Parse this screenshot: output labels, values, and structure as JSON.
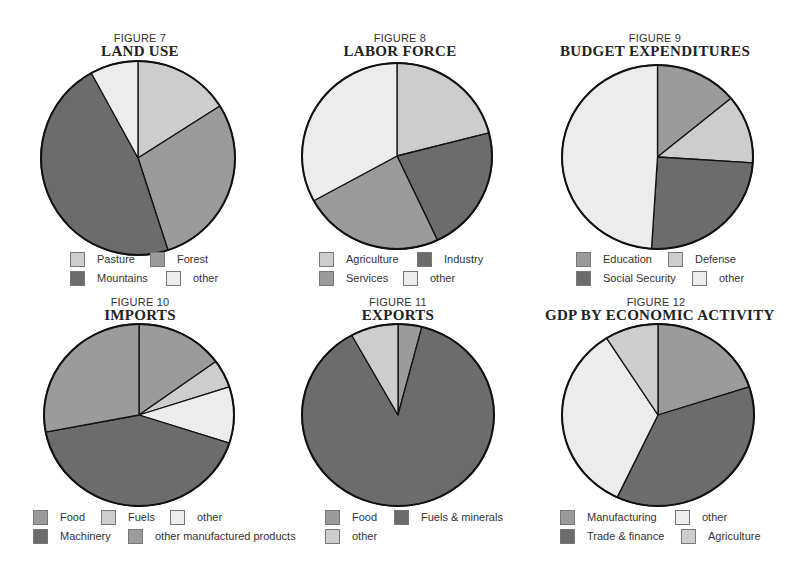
{
  "colors": {
    "light": "#cdcdcd",
    "mid": "#9b9b9b",
    "dark": "#6c6c6c",
    "white": "#ececec",
    "outline": "#111111"
  },
  "chart_data": [
    {
      "type": "pie",
      "figure_label": "FIGURE 7",
      "title": "LAND USE",
      "categories": [
        "Pasture",
        "Forest",
        "Mountains",
        "other"
      ],
      "values": [
        16,
        29,
        47,
        8
      ],
      "fills": [
        "light",
        "mid",
        "dark",
        "white"
      ],
      "legend": [
        {
          "label": "Pasture",
          "fill": "light"
        },
        {
          "label": "Forest",
          "fill": "mid"
        },
        {
          "label": "Mountains",
          "fill": "dark"
        },
        {
          "label": "other",
          "fill": "white"
        }
      ]
    },
    {
      "type": "pie",
      "figure_label": "FIGURE 8",
      "title": "LABOR FORCE",
      "categories": [
        "Agriculture",
        "Industry",
        "Services",
        "other"
      ],
      "values": [
        21,
        22,
        24,
        33
      ],
      "fills": [
        "light",
        "dark",
        "mid",
        "white"
      ],
      "legend": [
        {
          "label": "Agriculture",
          "fill": "light"
        },
        {
          "label": "Industry",
          "fill": "dark"
        },
        {
          "label": "Services",
          "fill": "mid"
        },
        {
          "label": "other",
          "fill": "white"
        }
      ]
    },
    {
      "type": "pie",
      "figure_label": "FIGURE 9",
      "title": "BUDGET EXPENDITURES",
      "categories": [
        "Education",
        "Defense",
        "Social Security",
        "other"
      ],
      "values": [
        14,
        12,
        25,
        49
      ],
      "fills": [
        "mid",
        "light",
        "dark",
        "white"
      ],
      "legend": [
        {
          "label": "Education",
          "fill": "mid"
        },
        {
          "label": "Defense",
          "fill": "light"
        },
        {
          "label": "Social Security",
          "fill": "dark"
        },
        {
          "label": "other",
          "fill": "white"
        }
      ]
    },
    {
      "type": "pie",
      "figure_label": "FIGURE 10",
      "title": "IMPORTS",
      "categories": [
        "Food",
        "Fuels",
        "other",
        "Machinery",
        "other manufactured products"
      ],
      "values": [
        15,
        5,
        10,
        42,
        28
      ],
      "fills": [
        "mid",
        "light",
        "white",
        "dark",
        "mid"
      ],
      "legend": [
        {
          "label": "Food",
          "fill": "mid"
        },
        {
          "label": "Fuels",
          "fill": "light"
        },
        {
          "label": "other",
          "fill": "white"
        },
        {
          "label": "Machinery",
          "fill": "dark"
        },
        {
          "label": "other manufactured products",
          "fill": "mid"
        }
      ]
    },
    {
      "type": "pie",
      "figure_label": "FIGURE 11",
      "title": "EXPORTS",
      "categories": [
        "Food",
        "Fuels & minerals",
        "other"
      ],
      "values": [
        4,
        88,
        8
      ],
      "fills": [
        "mid",
        "dark",
        "light"
      ],
      "legend": [
        {
          "label": "Food",
          "fill": "mid"
        },
        {
          "label": "Fuels & minerals",
          "fill": "dark"
        },
        {
          "label": "other",
          "fill": "light"
        }
      ]
    },
    {
      "type": "pie",
      "figure_label": "FIGURE 12",
      "title": "GDP BY ECONOMIC ACTIVITY",
      "categories": [
        "Manufacturing",
        "Trade & finance",
        "other",
        "Agriculture"
      ],
      "values": [
        20,
        37,
        34,
        9
      ],
      "fills": [
        "mid",
        "dark",
        "white",
        "light"
      ],
      "legend": [
        {
          "label": "Manufacturing",
          "fill": "mid"
        },
        {
          "label": "other",
          "fill": "white"
        },
        {
          "label": "Trade & finance",
          "fill": "dark"
        },
        {
          "label": "Agriculture",
          "fill": "light"
        }
      ]
    }
  ]
}
